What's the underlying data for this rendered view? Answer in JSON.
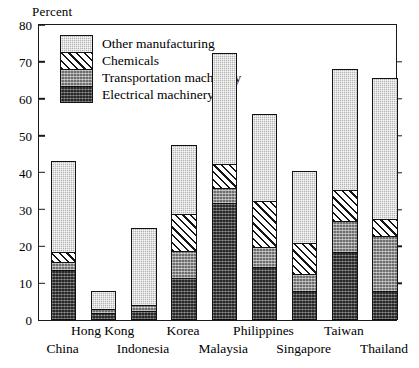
{
  "chart_data": {
    "type": "bar",
    "subtype": "stacked-vertical",
    "title": "",
    "ylabel": "Percent",
    "xlabel": "",
    "ylim": [
      0,
      80
    ],
    "yticks": [
      0,
      10,
      20,
      30,
      40,
      50,
      60,
      70,
      80
    ],
    "grid": false,
    "legend_position": "top-left inside plot",
    "categories": [
      "China",
      "Hong Kong",
      "Indonesia",
      "Korea",
      "Malaysia",
      "Philippines",
      "Singapore",
      "Taiwan",
      "Thailand"
    ],
    "series": [
      {
        "name": "Electrical machinery",
        "pattern": "dark-gray-stipple",
        "color": "#5a5a5a",
        "values": [
          13.3,
          1.5,
          2.0,
          11.0,
          31.5,
          14.0,
          7.5,
          18.0,
          7.5
        ]
      },
      {
        "name": "Transportation machinery",
        "pattern": "medium-gray-stipple",
        "color": "#8c8c8c",
        "values": [
          2.0,
          1.0,
          1.5,
          7.5,
          4.0,
          5.5,
          4.5,
          8.5,
          15.0
        ]
      },
      {
        "name": "Chemicals",
        "pattern": "diagonal-hatch",
        "color": "#ffffff",
        "values": [
          2.7,
          0.0,
          0.0,
          10.0,
          6.5,
          12.5,
          8.5,
          8.5,
          4.5
        ]
      },
      {
        "name": "Other manufacturing",
        "pattern": "light-gray-stipple",
        "color": "#b3b3b3",
        "values": [
          25.0,
          5.5,
          21.5,
          19.0,
          30.5,
          24.0,
          20.0,
          33.0,
          38.5
        ]
      }
    ],
    "totals": [
      43.0,
      8.0,
      25.0,
      47.5,
      72.5,
      56.0,
      40.5,
      68.0,
      65.5
    ]
  },
  "axis": {
    "ylabel": "Percent",
    "ticks": [
      "80",
      "70",
      "60",
      "50",
      "40",
      "30",
      "20",
      "10",
      "0"
    ]
  },
  "legend": {
    "items": [
      {
        "label": "Other manufacturing"
      },
      {
        "label": "Chemicals"
      },
      {
        "label": "Transportation machinery"
      },
      {
        "label": "Electrical machinery"
      }
    ]
  },
  "xlabels": {
    "top": [
      "Hong Kong",
      "Korea",
      "Philippines",
      "Taiwan"
    ],
    "bottom": [
      "China",
      "Indonesia",
      "Malaysia",
      "Singapore",
      "Thailand"
    ]
  }
}
